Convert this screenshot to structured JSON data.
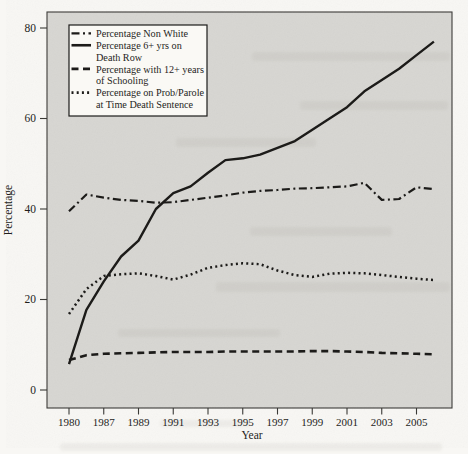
{
  "figure": {
    "page_bg": "#f8f7f4",
    "plot_bg": "#d7d6d2",
    "line_color": "#1c1b19",
    "legend_bg": "#faf9f5",
    "axis_color": "#3a3936"
  },
  "chart_data": {
    "type": "line",
    "title": "",
    "xlabel": "Year",
    "ylabel": "Percentage",
    "ylim": [
      0,
      80
    ],
    "y_ticks": [
      0,
      20,
      40,
      60,
      80
    ],
    "x_tick_years": [
      "1980",
      "1987",
      "1989",
      "1991",
      "1993",
      "1995",
      "1997",
      "1999",
      "2001",
      "2003",
      "2005"
    ],
    "x": [
      1980,
      1986,
      1987,
      1988,
      1989,
      1990,
      1991,
      1992,
      1993,
      1994,
      1995,
      1996,
      1997,
      1998,
      1999,
      2000,
      2001,
      2002,
      2003,
      2004,
      2005,
      2006
    ],
    "grid": false,
    "legend_position": "top-left",
    "series": [
      {
        "name": "Percentage Non White",
        "legend_lines": [
          "Percentage Non White"
        ],
        "style": "dashdot",
        "values": [
          39.5,
          43.2,
          42.5,
          42.0,
          41.8,
          41.4,
          41.5,
          42.0,
          42.5,
          43.0,
          43.6,
          44.0,
          44.2,
          44.5,
          44.6,
          44.8,
          45.0,
          45.8,
          42.0,
          42.2,
          44.8,
          44.4
        ]
      },
      {
        "name": "Percentage 6+ yrs on Death Row",
        "legend_lines": [
          "Percentage 6+ yrs on",
          "Death Row"
        ],
        "style": "solid",
        "values": [
          5.7,
          17.7,
          24.0,
          29.5,
          33.0,
          40.0,
          43.5,
          45.0,
          48.0,
          50.8,
          51.2,
          52.0,
          53.5,
          55.0,
          57.5,
          60.0,
          62.5,
          66.0,
          68.5,
          71.0,
          74.0,
          77.0
        ]
      },
      {
        "name": "Percentage with 12+ years of Schooling",
        "legend_lines": [
          "Percentage with 12+ years",
          "of Schooling"
        ],
        "style": "dashed",
        "values": [
          6.6,
          7.7,
          8.0,
          8.1,
          8.2,
          8.3,
          8.4,
          8.4,
          8.4,
          8.5,
          8.5,
          8.5,
          8.5,
          8.5,
          8.6,
          8.6,
          8.5,
          8.4,
          8.2,
          8.1,
          8.0,
          7.9
        ]
      },
      {
        "name": "Percentage on Prob/Parole at Time Death Sentence",
        "legend_lines": [
          "Percentage on Prob/Parole",
          "at Time Death Sentence"
        ],
        "style": "dotted",
        "values": [
          16.8,
          22.3,
          25.2,
          25.6,
          25.8,
          25.2,
          24.4,
          25.5,
          27.0,
          27.6,
          28.0,
          27.8,
          26.4,
          25.4,
          25.0,
          25.7,
          25.9,
          25.8,
          25.4,
          25.0,
          24.6,
          24.3
        ]
      }
    ]
  }
}
